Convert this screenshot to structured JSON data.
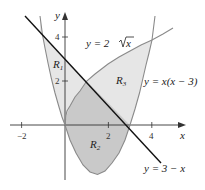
{
  "diagram": {
    "type": "region-between-curves",
    "axes": {
      "x_label": "x",
      "y_label": "y",
      "x_ticks": [
        {
          "value": -2,
          "label": "−2"
        },
        {
          "value": 2,
          "label": "2"
        },
        {
          "value": 4,
          "label": "4"
        }
      ],
      "y_ticks": [
        {
          "value": 2,
          "label": "2"
        },
        {
          "value": 4,
          "label": "4"
        }
      ]
    },
    "curves": [
      {
        "id": "sqrt",
        "label": "y = 2",
        "label_radical": "x",
        "equation": "y = 2√x",
        "color": "#8a8a8a"
      },
      {
        "id": "parabola",
        "label": "y = x(x − 3)",
        "equation": "y = x(x − 3)",
        "color": "#8a8a8a"
      },
      {
        "id": "line",
        "label": "y = 3 − x",
        "equation": "y = 3 − x",
        "color": "#111111"
      }
    ],
    "regions": [
      {
        "id": "R1",
        "label": "R",
        "subscript": "1",
        "fill": "#e6e6e6"
      },
      {
        "id": "R2",
        "label": "R",
        "subscript": "2",
        "fill": "#c9c9c9"
      },
      {
        "id": "R3",
        "label": "R",
        "subscript": "3",
        "fill": "#e6e6e6"
      }
    ],
    "colors": {
      "axis": "#333333",
      "light_fill": "#e6e6e6",
      "dark_fill": "#c9c9c9",
      "curve": "#8a8a8a",
      "line": "#111111"
    }
  }
}
